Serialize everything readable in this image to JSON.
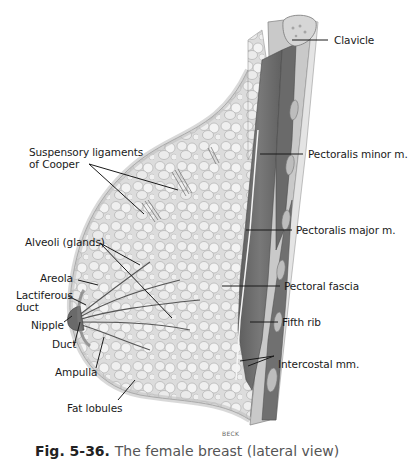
{
  "figure": {
    "caption_label": "Fig. 5-36.",
    "caption_text": "The female breast (lateral view)",
    "artist_credit": "BECK"
  },
  "labels": {
    "clavicle": "Clavicle",
    "pectoralis_minor": "Pectoralis minor m.",
    "pectoralis_major": "Pectoralis major m.",
    "pectoral_fascia": "Pectoral fascia",
    "fifth_rib": "Fifth rib",
    "intercostal": "Intercostal mm.",
    "suspensory_line1": "Suspensory ligaments",
    "suspensory_line2": "of Cooper",
    "alveoli": "Alveoli (glands)",
    "areola": "Areola",
    "lactiferous_line1": "Lactiferous",
    "lactiferous_line2": "duct",
    "nipple": "Nipple",
    "duct": "Duct",
    "ampulla": "Ampulla",
    "fat_lobules": "Fat lobules"
  },
  "colors": {
    "muscle": "#6e6e6e",
    "muscle_dark": "#555555",
    "tissue": "#d8d8d8",
    "lobule": "#ececec",
    "outline": "#8a8a8a",
    "leader": "#1a1a1a"
  }
}
